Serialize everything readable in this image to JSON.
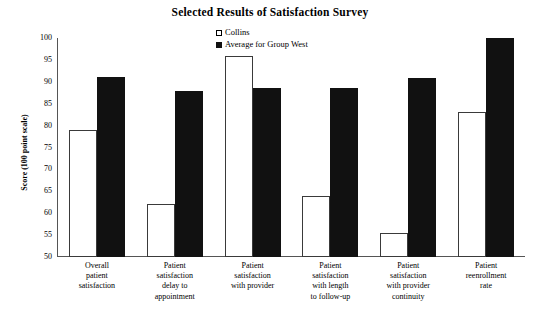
{
  "chart_data": {
    "type": "bar",
    "title": "Selected Results of Satisfaction Survey",
    "xlabel": "",
    "ylabel": "Score (100 point scale)",
    "ylim": [
      50,
      100
    ],
    "yticks": [
      100,
      95,
      90,
      85,
      80,
      75,
      70,
      65,
      60,
      55,
      50
    ],
    "ytick_labels": [
      "100",
      "95",
      "90",
      "85",
      "80",
      "75",
      "70",
      "65",
      "60",
      "55",
      "50"
    ],
    "grid": false,
    "legend_position": "top-center",
    "categories": [
      "Overall patient satisfaction",
      "Patient satisfaction delay to appointment",
      "Patient satisfaction with provider",
      "Patient satisfaction with length to follow-up",
      "Patient satisfaction with provider continuity",
      "Patient reenrollment rate"
    ],
    "category_lines": [
      [
        "Overall",
        "patient",
        "satisfaction"
      ],
      [
        "Patient",
        "satisfaction",
        "delay to",
        "appointment"
      ],
      [
        "Patient",
        "satisfaction",
        "with provider"
      ],
      [
        "Patient",
        "satisfaction",
        "with length",
        "to follow-up"
      ],
      [
        "Patient",
        "satisfaction",
        "with provider",
        "continuity"
      ],
      [
        "Patient",
        "reenrollment",
        "rate"
      ]
    ],
    "series": [
      {
        "name": "Collins",
        "color": "#ffffff",
        "edge_color": "#3a3a3a",
        "values": [
          79,
          62,
          96,
          64,
          55.5,
          83
        ]
      },
      {
        "name": "Average for Group West",
        "color": "#111111",
        "edge_color": "#111111",
        "values": [
          91,
          88,
          88.5,
          88.5,
          90.8,
          100
        ]
      }
    ]
  },
  "legend": {
    "items": [
      {
        "label": "Collins",
        "swatch": "hollow-square"
      },
      {
        "label": "Average for Group West",
        "swatch": "filled-square"
      }
    ]
  }
}
